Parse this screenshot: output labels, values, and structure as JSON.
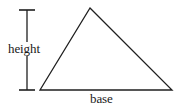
{
  "figure": {
    "type": "geometry-diagram",
    "background_color": "#ffffff",
    "stroke_color": "#1f1f1f",
    "text_color": "#1a1a1a",
    "labels": {
      "height": "height",
      "base": "base"
    },
    "triangle": {
      "apex": [
        90,
        8
      ],
      "bottom_left": [
        40,
        90
      ],
      "bottom_right": [
        172,
        90
      ]
    },
    "height_marker": {
      "line_x": 27,
      "top_y": 10,
      "bottom_y": 90,
      "tick_left_x": 19,
      "tick_right_x": 35
    }
  }
}
